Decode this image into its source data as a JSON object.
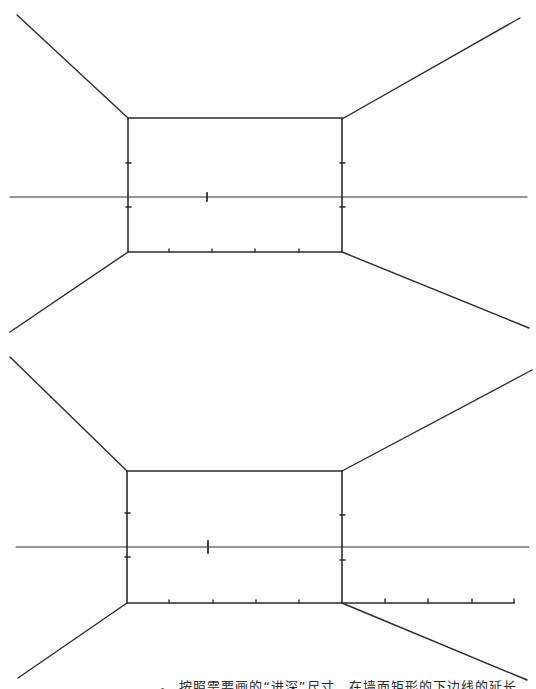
{
  "figure": {
    "stroke_color": "#2b2b2b",
    "background": "#ffffff"
  },
  "diagrams": [
    {
      "id": "upper",
      "back_wall": {
        "x1": 128,
        "y1": 118,
        "x2": 342,
        "y2": 252
      },
      "horizon": {
        "y": 197,
        "x1": 10,
        "x2": 527
      },
      "vanishing_point_tick": {
        "x": 207,
        "y": 197
      },
      "side_ticks_left": [
        163,
        207
      ],
      "side_ticks_right": [
        163,
        207
      ],
      "bottom_ticks": [
        169,
        212,
        255,
        299
      ],
      "diagonals": [
        {
          "from": [
            17,
            15
          ],
          "to": [
            128,
            118
          ]
        },
        {
          "from": [
            520,
            18
          ],
          "to": [
            342,
            119
          ]
        },
        {
          "from": [
            10,
            332
          ],
          "to": [
            128,
            252
          ]
        },
        {
          "from": [
            529,
            328
          ],
          "to": [
            342,
            252
          ]
        }
      ],
      "baseline_extension": null
    },
    {
      "id": "lower",
      "back_wall": {
        "x1": 127,
        "y1": 471,
        "x2": 342,
        "y2": 603
      },
      "horizon": {
        "y": 547,
        "x1": 16,
        "x2": 529
      },
      "vanishing_point_tick": {
        "x": 208,
        "y": 547
      },
      "side_ticks_left": [
        513,
        557
      ],
      "side_ticks_right": [
        515,
        560
      ],
      "bottom_ticks": [
        169,
        213,
        256,
        299
      ],
      "diagonals": [
        {
          "from": [
            10,
            357
          ],
          "to": [
            127,
            471
          ]
        },
        {
          "from": [
            532,
            370
          ],
          "to": [
            342,
            471
          ]
        },
        {
          "from": [
            18,
            678
          ],
          "to": [
            127,
            603
          ]
        },
        {
          "from": [
            527,
            680
          ],
          "to": [
            342,
            603
          ]
        }
      ],
      "baseline_extension": {
        "x1": 342,
        "x2": 514,
        "y": 603,
        "ticks": [
          385,
          428,
          472,
          514
        ]
      }
    }
  ],
  "caption": {
    "text": "。 按照需要画的“进深”尺寸，在墙面矩形的下边线的延长",
    "clipped": true
  }
}
